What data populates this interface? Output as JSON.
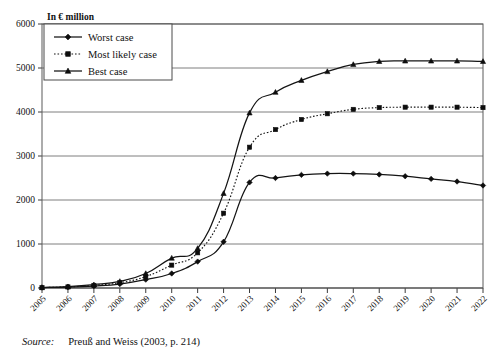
{
  "figure": {
    "unit_label": "In € million",
    "source_prefix": "Source:",
    "source_text": "Preuß and Weiss (2003, p. 214)"
  },
  "legend": {
    "items": [
      {
        "label": "Worst case",
        "marker": "diamond-marker",
        "style": "solid"
      },
      {
        "label": "Most likely case",
        "marker": "square-marker",
        "style": "dotted"
      },
      {
        "label": "Best case",
        "marker": "triangle-marker",
        "style": "solid"
      }
    ]
  },
  "chart_data": {
    "type": "line",
    "title": "",
    "subtitle": "",
    "xlabel": "",
    "ylabel": "In € million",
    "ylim": [
      0,
      6000
    ],
    "ytick_values": [
      0,
      1000,
      2000,
      3000,
      4000,
      5000,
      6000
    ],
    "ytick_labels": [
      "0",
      "1000",
      "2000",
      "3000",
      "4000",
      "5000",
      "6000"
    ],
    "grid": true,
    "legend_position": "top-left",
    "categories": [
      "2005",
      "2006",
      "2007",
      "2008",
      "2009",
      "2010",
      "2011",
      "2012",
      "2013",
      "2014",
      "2015",
      "2016",
      "2017",
      "2018",
      "2019",
      "2020",
      "2021",
      "2022"
    ],
    "x": [
      2005,
      2006,
      2007,
      2008,
      2009,
      2010,
      2011,
      2012,
      2013,
      2014,
      2015,
      2016,
      2017,
      2018,
      2019,
      2020,
      2021,
      2022
    ],
    "series": [
      {
        "name": "Worst case",
        "values": [
          10,
          20,
          45,
          90,
          190,
          330,
          600,
          1050,
          2400,
          2500,
          2570,
          2600,
          2600,
          2580,
          2540,
          2480,
          2420,
          2330
        ]
      },
      {
        "name": "Most likely case",
        "values": [
          10,
          25,
          60,
          120,
          260,
          520,
          800,
          1700,
          3200,
          3600,
          3830,
          3960,
          4060,
          4100,
          4110,
          4110,
          4110,
          4100
        ]
      },
      {
        "name": "Best case",
        "values": [
          10,
          30,
          75,
          150,
          330,
          680,
          900,
          2150,
          3980,
          4450,
          4720,
          4920,
          5080,
          5150,
          5160,
          5160,
          5160,
          5150
        ]
      }
    ]
  }
}
